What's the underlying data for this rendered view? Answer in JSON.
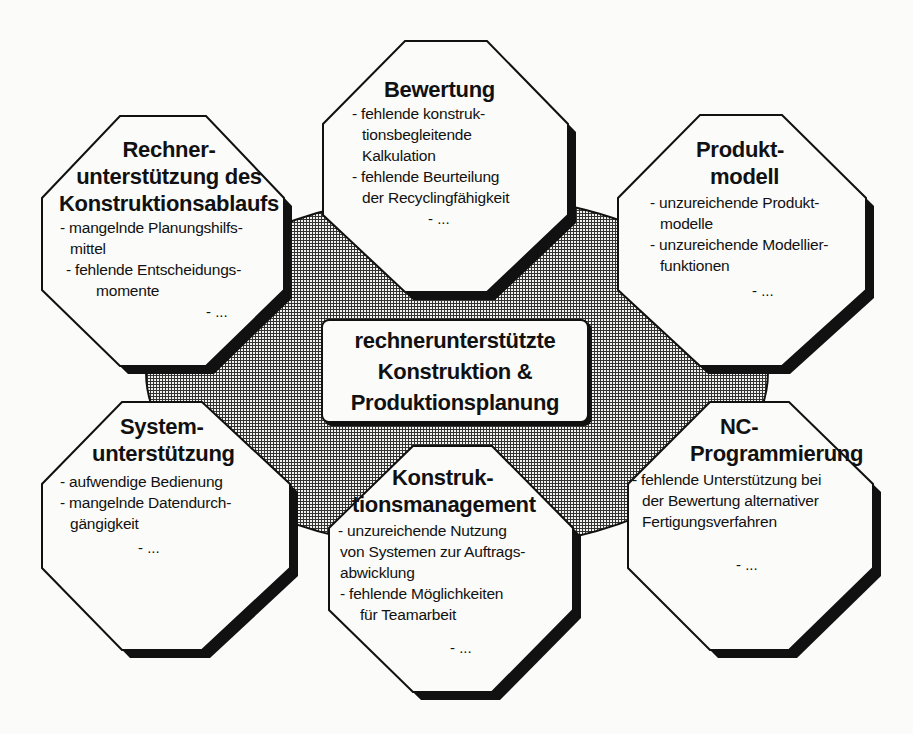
{
  "diagram": {
    "type": "hub-and-spoke problem map",
    "colors": {
      "background": "#fbfbf9",
      "outline": "#111111",
      "hub_pattern": "crosshatch grid",
      "box_fill": "#fbfbf9"
    },
    "center": {
      "lines": [
        "rechnerunterstützte",
        "Konstruktion &",
        "Produktionsplanung"
      ]
    },
    "boxes": [
      {
        "id": "rechnerunterstuetzung",
        "title_lines": [
          "Rechner-",
          "unterstützung des",
          "Konstruktionsablaufs"
        ],
        "items": [
          {
            "lines": [
              "- mangelnde Planungshilfs-",
              "mittel"
            ]
          },
          {
            "lines": [
              "- fehlende Entscheidungs-",
              "momente"
            ]
          }
        ],
        "more": "- ..."
      },
      {
        "id": "bewertung",
        "title_lines": [
          "Bewertung"
        ],
        "items": [
          {
            "lines": [
              "- fehlende konstruk-",
              "tionsbegleitende",
              "Kalkulation"
            ]
          },
          {
            "lines": [
              "- fehlende Beurteilung",
              "der Recyclingfähigkeit"
            ]
          }
        ],
        "more": "- ..."
      },
      {
        "id": "produktmodell",
        "title_lines": [
          "Produkt-",
          "modell"
        ],
        "items": [
          {
            "lines": [
              "- unzureichende Produkt-",
              "modelle"
            ]
          },
          {
            "lines": [
              "- unzureichende Modellier-",
              "funktionen"
            ]
          }
        ],
        "more": "- ..."
      },
      {
        "id": "systemunterstuetzung",
        "title_lines": [
          "System-",
          "unterstützung"
        ],
        "items": [
          {
            "lines": [
              "- aufwendige Bedienung"
            ]
          },
          {
            "lines": [
              "- mangelnde Datendurch-",
              "gängigkeit"
            ]
          }
        ],
        "more": "- ..."
      },
      {
        "id": "konstruktionsmanagement",
        "title_lines": [
          "Konstruk-",
          "tionsmanagement"
        ],
        "items": [
          {
            "lines": [
              "- unzureichende Nutzung",
              "von Systemen zur Auftrags-",
              "abwicklung"
            ]
          },
          {
            "lines": [
              "- fehlende Möglichkeiten",
              "für Teamarbeit"
            ]
          }
        ],
        "more": "- ..."
      },
      {
        "id": "nc-programmierung",
        "title_lines": [
          "NC-",
          "Programmierung"
        ],
        "items": [
          {
            "lines": [
              "- fehlende Unterstützung bei",
              "der Bewertung alternativer",
              "Fertigungsverfahren"
            ]
          }
        ],
        "more": "- ..."
      }
    ]
  }
}
